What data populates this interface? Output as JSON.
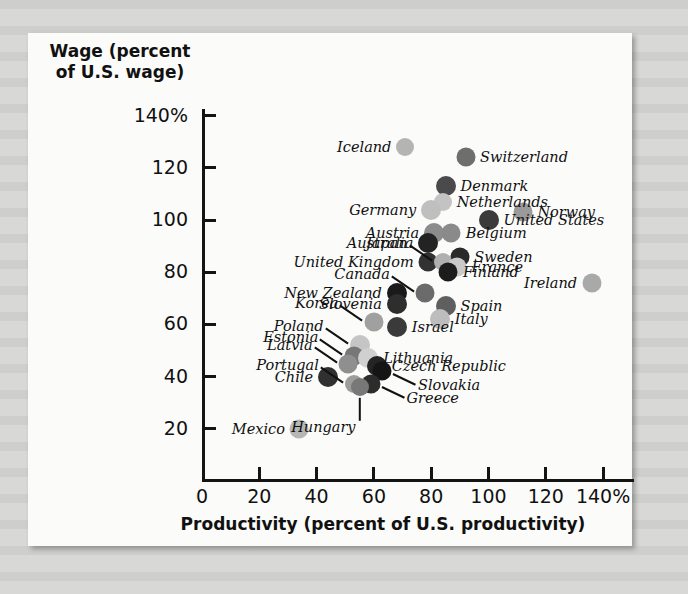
{
  "chart_data": {
    "type": "scatter",
    "title": "",
    "xlabel": "Productivity (percent of U.S. productivity)",
    "ylabel": "Wage (percent of U.S. wage)",
    "xlim": [
      0,
      145
    ],
    "ylim": [
      10,
      148
    ],
    "xticks": [
      "0",
      "20",
      "40",
      "60",
      "80",
      "100",
      "120",
      "140%"
    ],
    "xtick_values": [
      0,
      20,
      40,
      60,
      80,
      100,
      120,
      140
    ],
    "yticks": [
      "20",
      "40",
      "60",
      "80",
      "100",
      "120",
      "140%"
    ],
    "ytick_values": [
      20,
      40,
      60,
      80,
      100,
      120,
      140
    ],
    "grid": false,
    "legend": "none",
    "points": [
      {
        "label": "Iceland",
        "x": 71,
        "y": 128,
        "color": "#b4b4b4",
        "r": 9,
        "label_pos": "left"
      },
      {
        "label": "Switzerland",
        "x": 92,
        "y": 124,
        "color": "#6e6e6e",
        "r": 9.5,
        "label_pos": "right"
      },
      {
        "label": "Denmark",
        "x": 85,
        "y": 113,
        "color": "#4a4a4a",
        "r": 10,
        "label_pos": "right"
      },
      {
        "label": "Netherlands",
        "x": 84,
        "y": 107,
        "color": "#c3c3c3",
        "r": 9,
        "label_pos": "right"
      },
      {
        "label": "Germany",
        "x": 80,
        "y": 104,
        "color": "#bfbfbf",
        "r": 10,
        "label_pos": "left"
      },
      {
        "label": "Norway",
        "x": 112,
        "y": 103,
        "color": "#9a9a9a",
        "r": 9.5,
        "label_pos": "right"
      },
      {
        "label": "United States",
        "x": 100,
        "y": 100,
        "color": "#3b3b3b",
        "r": 10,
        "label_pos": "right"
      },
      {
        "label": "Austria",
        "x": 81,
        "y": 95,
        "color": "#8c8c8c",
        "r": 10,
        "label_pos": "left"
      },
      {
        "label": "Belgium",
        "x": 87,
        "y": 95,
        "color": "#8a8a8a",
        "r": 9.5,
        "label_pos": "right"
      },
      {
        "label": "Australia",
        "x": 79,
        "y": 91,
        "color": "#232323",
        "r": 10,
        "label_pos": "left"
      },
      {
        "label": "Sweden",
        "x": 90,
        "y": 86,
        "color": "#2a2a2a",
        "r": 9.5,
        "label_pos": "right"
      },
      {
        "label": "United Kingdom",
        "x": 79,
        "y": 84,
        "color": "#323232",
        "r": 9.5,
        "label_pos": "left"
      },
      {
        "label": "Japan",
        "x": 84,
        "y": 84,
        "color": "#b0b0b0",
        "r": 9,
        "label_pos": "left-leader"
      },
      {
        "label": "France",
        "x": 89,
        "y": 82,
        "color": "#c9c9c9",
        "r": 9.5,
        "label_pos": "right"
      },
      {
        "label": "Finland",
        "x": 86,
        "y": 80,
        "color": "#1c1c1c",
        "r": 9.5,
        "label_pos": "right"
      },
      {
        "label": "Ireland",
        "x": 136,
        "y": 76,
        "color": "#a9a9a9",
        "r": 9.5,
        "label_pos": "left"
      },
      {
        "label": "Canada",
        "x": 78,
        "y": 72,
        "color": "#6b6b6b",
        "r": 9.5,
        "label_pos": "left-leader"
      },
      {
        "label": "New Zealand",
        "x": 68,
        "y": 72,
        "color": "#1a1a1a",
        "r": 10,
        "label_pos": "left"
      },
      {
        "label": "Slovenia",
        "x": 68,
        "y": 68,
        "color": "#2e2e2e",
        "r": 10,
        "label_pos": "left"
      },
      {
        "label": "Spain",
        "x": 85,
        "y": 67,
        "color": "#5f5f5f",
        "r": 10,
        "label_pos": "right"
      },
      {
        "label": "Italy",
        "x": 83,
        "y": 62,
        "color": "#bdbdbd",
        "r": 10,
        "label_pos": "right"
      },
      {
        "label": "Korea",
        "x": 60,
        "y": 61,
        "color": "#a0a0a0",
        "r": 9.5,
        "label_pos": "left-leader"
      },
      {
        "label": "Israel",
        "x": 68,
        "y": 59,
        "color": "#3a3a3a",
        "r": 10,
        "label_pos": "right"
      },
      {
        "label": "Poland",
        "x": 55,
        "y": 52,
        "color": "#c5c5c5",
        "r": 10,
        "label_pos": "left-leader"
      },
      {
        "label": "Estonia",
        "x": 53,
        "y": 48,
        "color": "#777777",
        "r": 9.5,
        "label_pos": "left-leader"
      },
      {
        "label": "Lithuania",
        "x": 58,
        "y": 47,
        "color": "#d0d0d0",
        "r": 10,
        "label_pos": "right"
      },
      {
        "label": "Latvia",
        "x": 51,
        "y": 45,
        "color": "#8f8f8f",
        "r": 9.5,
        "label_pos": "left-leader"
      },
      {
        "label": "Czech Republic",
        "x": 61,
        "y": 44,
        "color": "#242424",
        "r": 10,
        "label_pos": "right"
      },
      {
        "label": "Slovakia",
        "x": 63,
        "y": 42,
        "color": "#151515",
        "r": 9.5,
        "label_pos": "right-leader"
      },
      {
        "label": "Chile",
        "x": 44,
        "y": 40,
        "color": "#303030",
        "r": 10,
        "label_pos": "left"
      },
      {
        "label": "Portugal",
        "x": 53,
        "y": 37,
        "color": "#9d9d9d",
        "r": 9,
        "label_pos": "left-leader"
      },
      {
        "label": "Greece",
        "x": 59,
        "y": 37,
        "color": "#2c2c2c",
        "r": 9.5,
        "label_pos": "right-leader"
      },
      {
        "label": "Hungary",
        "x": 55,
        "y": 36,
        "color": "#787878",
        "r": 9,
        "label_pos": "below-leader"
      },
      {
        "label": "Mexico",
        "x": 34,
        "y": 20,
        "color": "#b6b6b6",
        "r": 9.5,
        "label_pos": "left"
      }
    ]
  }
}
